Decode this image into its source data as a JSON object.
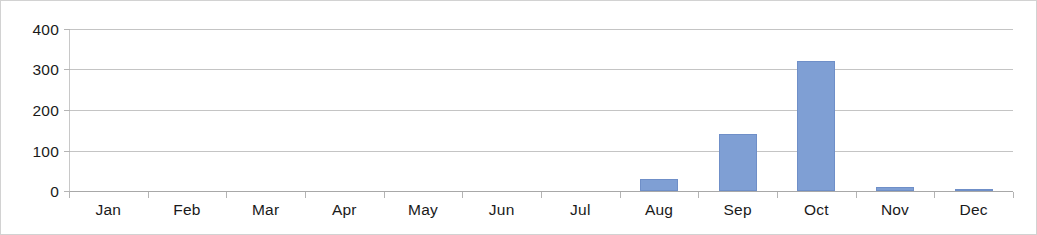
{
  "chart_data": {
    "type": "bar",
    "title": "",
    "subtitle": "",
    "xlabel": "",
    "ylabel": "",
    "categories": [
      "Jan",
      "Feb",
      "Mar",
      "Apr",
      "May",
      "Jun",
      "Jul",
      "Aug",
      "Sep",
      "Oct",
      "Nov",
      "Dec"
    ],
    "values": [
      0,
      0,
      0,
      0,
      0,
      0,
      0,
      30,
      140,
      320,
      10,
      5
    ],
    "series": [
      {
        "name": "",
        "values": [
          0,
          0,
          0,
          0,
          0,
          0,
          0,
          30,
          140,
          320,
          10,
          5
        ],
        "color": "#7F9FD4"
      }
    ],
    "ylim": [
      0,
      400
    ],
    "y_ticks": [
      0,
      100,
      200,
      300,
      400
    ],
    "y_tick_labels": [
      "0",
      "100",
      "200",
      "300",
      "400"
    ],
    "grid": true,
    "grid_axis": "y",
    "legend": false,
    "legend_position": "none",
    "annotations": []
  },
  "style": {
    "bar_color": "#7F9FD4",
    "bar_border_color": "#6F8FC8",
    "gridline_color": "#C4C4C4",
    "axis_color": "#B4B4B4",
    "frame_border_color": "#D2D2D2",
    "background_color": "#FFFFFF",
    "text_color": "#1A1A1A"
  }
}
